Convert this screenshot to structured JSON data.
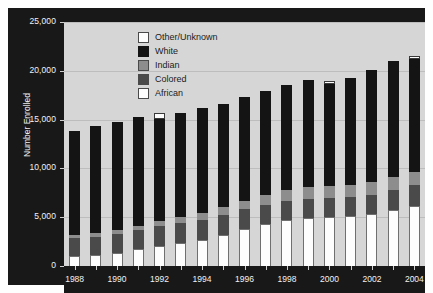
{
  "chart_data": {
    "type": "bar",
    "subtype": "stacked-bar",
    "title": "",
    "xlabel": "",
    "ylabel": "Number Enrolled",
    "ylim": [
      0,
      25000
    ],
    "ytick_labels": [
      "0",
      "5,000",
      "10,000",
      "15,000",
      "20,000",
      "25,000"
    ],
    "ytick_values": [
      0,
      5000,
      10000,
      15000,
      20000,
      25000
    ],
    "grid": true,
    "legend_position": "upper-center",
    "categories": [
      1988,
      1989,
      1990,
      1991,
      1992,
      1993,
      1994,
      1995,
      1996,
      1997,
      1998,
      1999,
      2000,
      2001,
      2002,
      2003,
      2004
    ],
    "xtick_labels": [
      "1988",
      "1990",
      "1992",
      "1994",
      "1996",
      "1998",
      "2000",
      "2002",
      "2004"
    ],
    "xtick_values": [
      1988,
      1990,
      1992,
      1994,
      1996,
      1998,
      2000,
      2002,
      2004
    ],
    "series": [
      {
        "name": "African",
        "color": "#fdfdfd",
        "values": [
          1000,
          1100,
          1300,
          1700,
          2100,
          2400,
          2700,
          3200,
          3800,
          4300,
          4700,
          4900,
          5000,
          5100,
          5300,
          5700,
          6200
        ]
      },
      {
        "name": "Colored",
        "color": "#4a4a4a",
        "values": [
          1900,
          1900,
          2000,
          2000,
          2000,
          2000,
          2000,
          2000,
          2000,
          2000,
          2000,
          2000,
          2000,
          2000,
          2000,
          2100,
          2100
        ]
      },
      {
        "name": "Indian",
        "color": "#8d8d8d",
        "values": [
          300,
          350,
          400,
          450,
          500,
          600,
          700,
          800,
          900,
          1000,
          1100,
          1200,
          1200,
          1200,
          1300,
          1300,
          1300
        ]
      },
      {
        "name": "White",
        "color": "#141414",
        "values": [
          10600,
          11000,
          11100,
          11100,
          10500,
          10700,
          10800,
          10600,
          10600,
          10600,
          10700,
          11000,
          10400,
          11000,
          11500,
          11900,
          11600
        ]
      },
      {
        "name": "Other/Unknown",
        "color": "#fdfdfd",
        "values": [
          0,
          0,
          0,
          0,
          600,
          0,
          0,
          0,
          0,
          0,
          0,
          0,
          400,
          0,
          0,
          0,
          300
        ]
      }
    ],
    "totals": [
      13800,
      14350,
      14800,
      15250,
      15700,
      15700,
      16200,
      16600,
      17300,
      17900,
      18500,
      19100,
      19000,
      19300,
      20100,
      21000,
      21500
    ]
  },
  "legend": {
    "items": [
      {
        "label": "Other/Unknown",
        "swatch": "sw-other"
      },
      {
        "label": "White",
        "swatch": "sw-white"
      },
      {
        "label": "Indian",
        "swatch": "sw-indian"
      },
      {
        "label": "Colored",
        "swatch": "sw-colored"
      },
      {
        "label": "African",
        "swatch": "sw-african"
      }
    ]
  },
  "axis": {
    "y_title": "Number Enrolled"
  }
}
